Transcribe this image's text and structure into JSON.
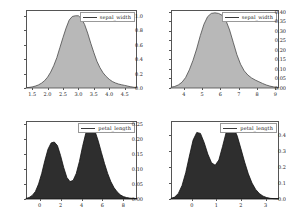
{
  "figure": {
    "panel_count": 4,
    "layout": "2x2 grid of kernel density plots"
  },
  "chart_data": [
    {
      "id": "top-left",
      "type": "area",
      "title": "",
      "xlabel": "",
      "ylabel": "",
      "legend": "sepal_width",
      "legend_position": "top-right",
      "grid": false,
      "fill_color": "#b8b8b8",
      "line_color": "#4a4a4a",
      "xlim": [
        1.3,
        4.9
      ],
      "ylim": [
        0.0,
        1.08
      ],
      "xticks": [
        "1.5",
        "2.0",
        "2.5",
        "3.0",
        "3.5",
        "4.0",
        "4.5"
      ],
      "xtick_values": [
        1.5,
        2.0,
        2.5,
        3.0,
        3.5,
        4.0,
        4.5
      ],
      "yticks": [
        "0.0",
        "0.2",
        "0.4",
        "0.6",
        "0.8",
        "1.0"
      ],
      "ytick_values": [
        0.0,
        0.2,
        0.4,
        0.6,
        0.8,
        1.0
      ],
      "x": [
        1.3,
        1.4,
        1.5,
        1.6,
        1.7,
        1.8,
        1.9,
        2.0,
        2.1,
        2.2,
        2.3,
        2.4,
        2.5,
        2.6,
        2.7,
        2.8,
        2.9,
        3.0,
        3.1,
        3.2,
        3.3,
        3.4,
        3.5,
        3.6,
        3.7,
        3.8,
        3.9,
        4.0,
        4.1,
        4.2,
        4.3,
        4.4,
        4.5,
        4.6,
        4.7,
        4.8,
        4.9
      ],
      "y": [
        0.004,
        0.008,
        0.015,
        0.026,
        0.042,
        0.066,
        0.1,
        0.15,
        0.22,
        0.31,
        0.42,
        0.56,
        0.7,
        0.83,
        0.94,
        0.99,
        1.0,
        1.0,
        0.96,
        0.88,
        0.76,
        0.62,
        0.49,
        0.37,
        0.28,
        0.21,
        0.16,
        0.12,
        0.09,
        0.07,
        0.055,
        0.045,
        0.036,
        0.026,
        0.017,
        0.01,
        0.005
      ]
    },
    {
      "id": "top-right",
      "type": "area",
      "title": "",
      "xlabel": "",
      "ylabel": "",
      "legend": "sepal_width",
      "legend_position": "top-right",
      "grid": false,
      "fill_color": "#b8b8b8",
      "line_color": "#4a4a4a",
      "xlim": [
        3.3,
        9.2
      ],
      "ylim": [
        0.0,
        0.41
      ],
      "xticks": [
        "4",
        "5",
        "6",
        "7",
        "8",
        "9"
      ],
      "xtick_values": [
        4,
        5,
        6,
        7,
        8,
        9
      ],
      "yticks": [
        "0.00",
        "0.05",
        "0.10",
        "0.15",
        "0.20",
        "0.25",
        "0.30",
        "0.35",
        "0.40"
      ],
      "ytick_values": [
        0.0,
        0.05,
        0.1,
        0.15,
        0.2,
        0.25,
        0.3,
        0.35,
        0.4
      ],
      "x": [
        3.3,
        3.5,
        3.7,
        3.9,
        4.1,
        4.3,
        4.5,
        4.7,
        4.9,
        5.1,
        5.3,
        5.5,
        5.7,
        5.9,
        6.1,
        6.3,
        6.5,
        6.7,
        6.9,
        7.1,
        7.3,
        7.5,
        7.7,
        7.9,
        8.1,
        8.3,
        8.5,
        8.7,
        8.9,
        9.1,
        9.2
      ],
      "y": [
        0.004,
        0.008,
        0.016,
        0.03,
        0.055,
        0.095,
        0.145,
        0.205,
        0.275,
        0.335,
        0.375,
        0.392,
        0.395,
        0.392,
        0.382,
        0.355,
        0.305,
        0.24,
        0.175,
        0.125,
        0.09,
        0.068,
        0.053,
        0.042,
        0.033,
        0.024,
        0.016,
        0.01,
        0.006,
        0.003,
        0.002
      ]
    },
    {
      "id": "bottom-left",
      "type": "area",
      "title": "",
      "xlabel": "",
      "ylabel": "",
      "legend": "petal_length",
      "legend_position": "top-right",
      "grid": false,
      "fill_color": "#2e2e2e",
      "line_color": "#111111",
      "xlim": [
        -1.3,
        9.3
      ],
      "ylim": [
        0.0,
        0.26
      ],
      "xticks": [
        "0",
        "2",
        "4",
        "6",
        "8"
      ],
      "xtick_values": [
        0,
        2,
        4,
        6,
        8
      ],
      "yticks": [
        "0.00",
        "0.05",
        "0.10",
        "0.15",
        "0.20",
        "0.25"
      ],
      "ytick_values": [
        0.0,
        0.05,
        0.1,
        0.15,
        0.2,
        0.25
      ],
      "x": [
        -1.3,
        -1.0,
        -0.7,
        -0.4,
        -0.1,
        0.2,
        0.5,
        0.8,
        1.1,
        1.4,
        1.7,
        2.0,
        2.3,
        2.6,
        2.9,
        3.2,
        3.5,
        3.8,
        4.1,
        4.4,
        4.7,
        5.0,
        5.3,
        5.6,
        5.9,
        6.2,
        6.5,
        6.8,
        7.1,
        7.4,
        7.7,
        8.0,
        8.3,
        8.6,
        8.9,
        9.2,
        9.3
      ],
      "y": [
        0.002,
        0.005,
        0.012,
        0.025,
        0.05,
        0.085,
        0.128,
        0.166,
        0.187,
        0.19,
        0.178,
        0.145,
        0.105,
        0.072,
        0.058,
        0.062,
        0.085,
        0.125,
        0.175,
        0.218,
        0.243,
        0.244,
        0.225,
        0.193,
        0.155,
        0.118,
        0.085,
        0.058,
        0.038,
        0.024,
        0.014,
        0.008,
        0.005,
        0.003,
        0.002,
        0.001,
        0.001
      ]
    },
    {
      "id": "bottom-right",
      "type": "area",
      "title": "",
      "xlabel": "",
      "ylabel": "",
      "legend": "petal_length",
      "legend_position": "top-right",
      "grid": false,
      "fill_color": "#2e2e2e",
      "line_color": "#111111",
      "xlim": [
        -0.85,
        3.55
      ],
      "ylim": [
        0.0,
        0.49
      ],
      "xticks": [
        "0",
        "1",
        "2",
        "3"
      ],
      "xtick_values": [
        0,
        1,
        2,
        3
      ],
      "yticks": [
        "0.0",
        "0.1",
        "0.2",
        "0.3",
        "0.4"
      ],
      "ytick_values": [
        0.0,
        0.1,
        0.2,
        0.3,
        0.4
      ],
      "x": [
        -0.85,
        -0.7,
        -0.55,
        -0.4,
        -0.25,
        -0.1,
        0.05,
        0.2,
        0.35,
        0.5,
        0.65,
        0.8,
        0.95,
        1.1,
        1.25,
        1.4,
        1.55,
        1.7,
        1.85,
        2.0,
        2.15,
        2.3,
        2.45,
        2.6,
        2.75,
        2.9,
        3.05,
        3.2,
        3.35,
        3.5,
        3.55
      ],
      "y": [
        0.004,
        0.012,
        0.035,
        0.085,
        0.165,
        0.27,
        0.37,
        0.418,
        0.412,
        0.355,
        0.282,
        0.228,
        0.212,
        0.245,
        0.33,
        0.42,
        0.462,
        0.45,
        0.395,
        0.315,
        0.232,
        0.158,
        0.1,
        0.06,
        0.034,
        0.018,
        0.009,
        0.004,
        0.002,
        0.001,
        0.001
      ]
    }
  ]
}
